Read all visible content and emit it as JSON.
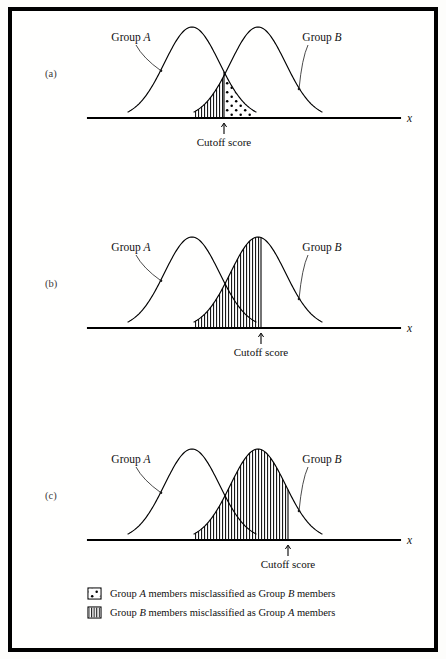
{
  "figure": {
    "axis_label": "x",
    "cutoff_label": "Cutoff score",
    "group_a_label_prefix": "Group ",
    "group_a_label_italic": "A",
    "group_b_label_prefix": "Group ",
    "group_b_label_italic": "B",
    "panels": [
      {
        "id": "a",
        "label": "(a)",
        "cutoff_x": 224,
        "baseline_y": 118
      },
      {
        "id": "b",
        "label": "(b)",
        "cutoff_x": 261,
        "baseline_y": 328
      },
      {
        "id": "c",
        "label": "(c)",
        "cutoff_x": 288,
        "baseline_y": 540
      }
    ],
    "legend": [
      {
        "pattern": "dots",
        "swatch_name": "legend-swatch-dots",
        "segments": [
          {
            "text": "Group ",
            "italic": false
          },
          {
            "text": "A",
            "italic": true
          },
          {
            "text": " members misclassified as Group ",
            "italic": false
          },
          {
            "text": "B",
            "italic": true
          },
          {
            "text": " members",
            "italic": false
          }
        ]
      },
      {
        "pattern": "hatch",
        "swatch_name": "legend-swatch-hatch",
        "segments": [
          {
            "text": "Group ",
            "italic": false
          },
          {
            "text": "B",
            "italic": true
          },
          {
            "text": " members misclassified as Group ",
            "italic": false
          },
          {
            "text": "A",
            "italic": true
          },
          {
            "text": " members",
            "italic": false
          }
        ]
      }
    ]
  },
  "chart_data": {
    "type": "line",
    "title": "",
    "xlabel": "x",
    "ylabel": "",
    "grid": false,
    "legend_position": "bottom",
    "axis": {
      "x_start": 88,
      "x_end": 400
    },
    "curves": [
      {
        "name": "Group A",
        "mean": 192,
        "sigma": 27.5,
        "amplitude": 91,
        "x_min": 128,
        "x_max": 256
      },
      {
        "name": "Group B",
        "mean": 258,
        "sigma": 27.5,
        "amplitude": 91,
        "x_min": 194,
        "x_max": 322
      }
    ],
    "panels": [
      {
        "panel": "(a)",
        "cutoff_x": 224,
        "cutoff_note": "cutoff at the intersection of the two curves",
        "regions": [
          {
            "pattern": "hatch",
            "meaning": "Group B members misclassified as Group A members",
            "bounded_by": "Group B curve",
            "side": "left of cutoff",
            "relative_area": "moderate"
          },
          {
            "pattern": "dots",
            "meaning": "Group A members misclassified as Group B members",
            "bounded_by": "Group A curve",
            "side": "right of cutoff",
            "relative_area": "moderate"
          }
        ]
      },
      {
        "panel": "(b)",
        "cutoff_x": 261,
        "cutoff_note": "cutoff shifted right to the peak of Group B",
        "regions": [
          {
            "pattern": "hatch",
            "meaning": "Group B members misclassified as Group A members",
            "bounded_by": "Group B curve",
            "side": "left of cutoff",
            "relative_area": "large"
          },
          {
            "pattern": "dots",
            "meaning": "Group A members misclassified as Group B members",
            "bounded_by": "Group A curve",
            "side": "right of cutoff",
            "relative_area": "small"
          }
        ]
      },
      {
        "panel": "(c)",
        "cutoff_x": 288,
        "cutoff_note": "cutoff shifted far right beyond the peak of Group B",
        "regions": [
          {
            "pattern": "hatch",
            "meaning": "Group B members misclassified as Group A members",
            "bounded_by": "Group B curve",
            "side": "left of cutoff",
            "relative_area": "very large"
          },
          {
            "pattern": "dots",
            "meaning": "Group A members misclassified as Group B members",
            "bounded_by": "Group A curve",
            "side": "right of cutoff",
            "relative_area": "very small"
          }
        ]
      }
    ]
  }
}
